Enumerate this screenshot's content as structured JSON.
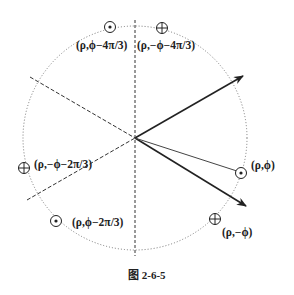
{
  "figure": {
    "caption": "图 2-6-5",
    "center": [
      135,
      138
    ],
    "radius": 112
  },
  "labels": {
    "p_phi": "(ρ,ϕ)",
    "p_neg_phi": "(ρ,−ϕ)",
    "p_phi_minus_4pi3": "(ρ,ϕ−4π/3)",
    "p_neg_phi_minus_4pi3": "(ρ,−ϕ−4π/3)",
    "p_neg_phi_minus_2pi3": "(ρ,−ϕ−2π/3)",
    "p_phi_minus_2pi3": "(ρ,ϕ−2π/3)"
  },
  "markers": {
    "dot": "out-of-page (⊙)",
    "cross": "into-page (⊗)"
  },
  "colors": {
    "line": "#222222",
    "dotted_circle": "#666666"
  }
}
